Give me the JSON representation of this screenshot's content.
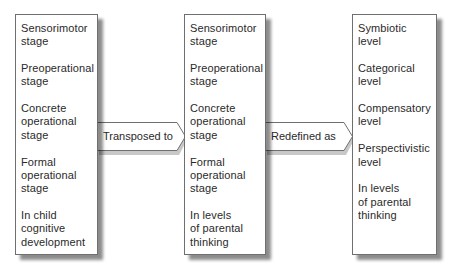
{
  "diagram": {
    "boxes": [
      {
        "id": "piaget-stages",
        "items": [
          "Sensorimotor\nstage",
          "Preoperational\nstage",
          "Concrete\noperational\nstage",
          "Formal\noperational\nstage",
          "In child\ncognitive\ndevelopment"
        ]
      },
      {
        "id": "transposed-stages",
        "items": [
          "Sensorimotor\nstage",
          "Preoperational\nstage",
          "Concrete\noperational\nstage",
          "Formal\noperational\nstage",
          "In levels\nof parental\nthinking"
        ]
      },
      {
        "id": "parental-levels",
        "items": [
          "Symbiotic\nlevel",
          "Categorical\nlevel",
          "Compensatory\nlevel",
          "Perspectivistic\nlevel",
          "In levels\nof parental\nthinking"
        ]
      }
    ],
    "arrows": [
      {
        "label": "Transposed to",
        "from": "piaget-stages",
        "to": "transposed-stages"
      },
      {
        "label": "Redefined as",
        "from": "transposed-stages",
        "to": "parental-levels"
      }
    ]
  },
  "colors": {
    "border": "#6f6f6f",
    "text": "#2a2a2a",
    "shadow": "#8a8a8a",
    "background": "#ffffff"
  }
}
